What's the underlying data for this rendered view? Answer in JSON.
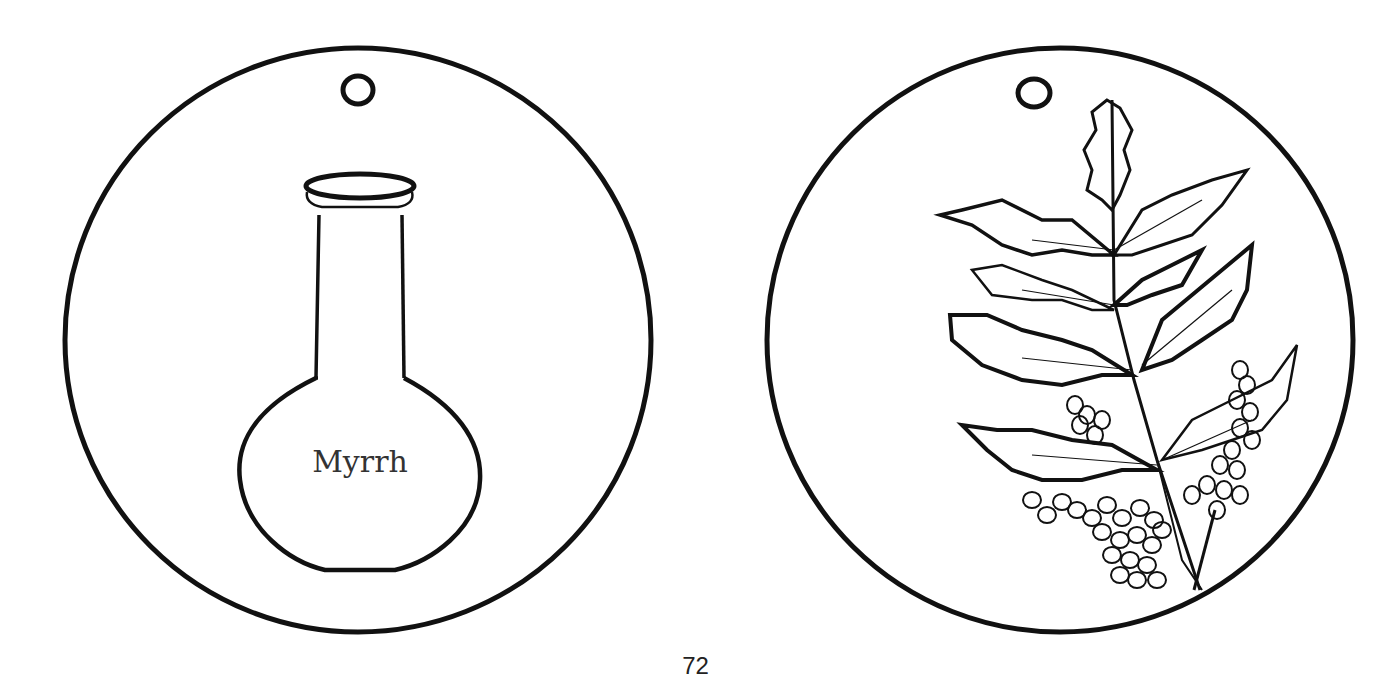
{
  "page": {
    "number": "72",
    "background_color": "#ffffff",
    "line_color": "#111111"
  },
  "ornaments": [
    {
      "id": "left",
      "icon": "flask-icon",
      "label": "Myrrh",
      "has_hanging_hole": true
    },
    {
      "id": "right",
      "icon": "myrrh-branch-icon",
      "has_hanging_hole": true
    }
  ]
}
